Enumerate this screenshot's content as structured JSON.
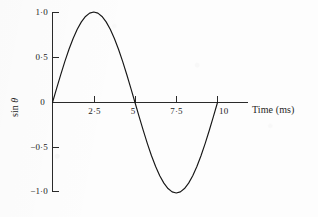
{
  "figure": {
    "background_color": "#fdfdfd",
    "ink_color": "#161616",
    "axis_color": "#2a2a2a"
  },
  "axes": {
    "x_title": "Time (ms)",
    "y_title_prefix": "sin ",
    "y_title_symbol": "θ"
  },
  "labels": {
    "y": {
      "pos_one": "1·0",
      "pos_half": "0·5",
      "zero": "0",
      "neg_half": "−0·5",
      "neg_one": "−1·0"
    },
    "x": {
      "two_five": "2·5",
      "five": "5",
      "seven_five": "7·5",
      "ten": "10"
    }
  },
  "chart_data": {
    "type": "line",
    "title": "",
    "subtitle": "",
    "xlabel": "Time (ms)",
    "ylabel": "sin θ",
    "xlim": [
      0,
      10
    ],
    "ylim": [
      -1.0,
      1.0
    ],
    "grid": false,
    "legend": "none",
    "x_ticks": [
      0,
      2.5,
      5,
      7.5,
      10
    ],
    "x_tick_labels": [
      "0",
      "2·5",
      "5",
      "7·5",
      "10"
    ],
    "y_ticks": [
      -1.0,
      -0.5,
      0,
      0.5,
      1.0
    ],
    "y_tick_labels": [
      "−1·0",
      "−0·5",
      "0",
      "0·5",
      "1·0"
    ],
    "annotations": [],
    "series": [
      {
        "name": "sin θ",
        "equation": "y = sin(2πt/10)",
        "period_ms": 10,
        "amplitude": 1.0,
        "x": [
          0,
          0.25,
          0.5,
          0.75,
          1,
          1.25,
          1.5,
          1.75,
          2,
          2.25,
          2.5,
          2.75,
          3,
          3.25,
          3.5,
          3.75,
          4,
          4.25,
          4.5,
          4.75,
          5,
          5.25,
          5.5,
          5.75,
          6,
          6.25,
          6.5,
          6.75,
          7,
          7.25,
          7.5,
          7.75,
          8,
          8.25,
          8.5,
          8.75,
          9,
          9.25,
          9.5,
          9.75,
          10
        ],
        "values": [
          0,
          0.156,
          0.309,
          0.454,
          0.588,
          0.707,
          0.809,
          0.891,
          0.951,
          0.988,
          1.0,
          0.988,
          0.951,
          0.891,
          0.809,
          0.707,
          0.588,
          0.454,
          0.309,
          0.156,
          0,
          -0.156,
          -0.309,
          -0.454,
          -0.588,
          -0.707,
          -0.809,
          -0.891,
          -0.951,
          -0.988,
          -1.0,
          -0.988,
          -0.951,
          -0.891,
          -0.809,
          -0.707,
          -0.588,
          -0.454,
          -0.309,
          -0.156,
          0
        ]
      }
    ],
    "key_points": {
      "maximum": {
        "x": 2.5,
        "y": 1.0
      },
      "minimum": {
        "x": 7.5,
        "y": -1.0
      },
      "zero_crossings": [
        0,
        5,
        10
      ]
    }
  }
}
